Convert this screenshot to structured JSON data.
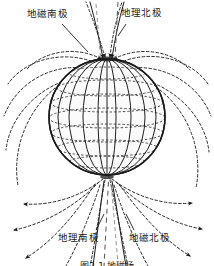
{
  "figure": {
    "title_semantic": "earth-magnetic-field-diagram",
    "caption": "图2-1 地磁场",
    "labels": {
      "geomagnetic_south_pole": "地磁南极",
      "geographic_north_pole": "地理北极",
      "geographic_south_pole": "地理南极",
      "geomagnetic_north_pole": "地磁北极"
    },
    "colors": {
      "ink": "#1a1a1a",
      "background": "#ffffff",
      "globe_fill": "#fbfbfb",
      "grid": "#3a3a3a",
      "field_line": "#2b2b2b"
    },
    "globe": {
      "center_x": 107,
      "center_y": 117,
      "radius": 58,
      "latitude_count": 7,
      "longitude_count": 9
    },
    "axes": {
      "geographic_axis_style": "dashed-vertical",
      "magnetic_axis_style": "solid-tilted",
      "magnetic_tilt_degrees": 11
    },
    "field_lines": {
      "style": "dashed",
      "direction": "into-north-pole-out-of-south-pole",
      "arrow_count": 16
    }
  }
}
